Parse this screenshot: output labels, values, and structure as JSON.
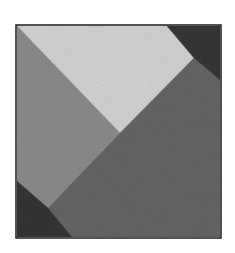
{
  "image": {
    "description": "Grayscale texture mosaic: a square divided into four textured polygonal regions",
    "frame": {
      "x": 16,
      "y": 25,
      "width": 205,
      "height": 213,
      "border_color": "#1a1a1a"
    },
    "regions": [
      {
        "name": "light-texture-region",
        "color": "#d4d4d4",
        "noise": "#bdbdbd",
        "points": [
          [
            17,
            26
          ],
          [
            167,
            26
          ],
          [
            194,
            58
          ],
          [
            120,
            133
          ]
        ]
      },
      {
        "name": "mid-gray-left-region",
        "color": "#8c8c8c",
        "noise": "#7e7e7e",
        "points": [
          [
            17,
            26
          ],
          [
            120,
            133
          ],
          [
            48,
            208
          ],
          [
            17,
            181
          ]
        ]
      },
      {
        "name": "dark-gray-lower-right-region",
        "color": "#666666",
        "noise": "#555555",
        "points": [
          [
            120,
            133
          ],
          [
            194,
            58
          ],
          [
            220,
            80
          ],
          [
            220,
            237
          ],
          [
            72,
            237
          ],
          [
            48,
            208
          ]
        ]
      },
      {
        "name": "top-right-dark-corner",
        "color": "#363636",
        "noise": "#222222",
        "points": [
          [
            167,
            26
          ],
          [
            220,
            26
          ],
          [
            220,
            80
          ],
          [
            194,
            58
          ]
        ]
      },
      {
        "name": "bottom-left-dark-corner",
        "color": "#353535",
        "noise": "#1f1f1f",
        "points": [
          [
            17,
            181
          ],
          [
            48,
            208
          ],
          [
            72,
            237
          ],
          [
            17,
            237
          ]
        ]
      }
    ]
  }
}
